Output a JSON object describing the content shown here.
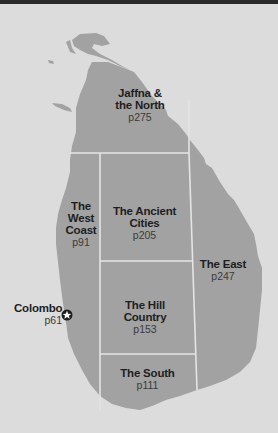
{
  "map": {
    "colors": {
      "background": "#dcdcdc",
      "land": "#a2a2a2",
      "border": "#e4e4e4",
      "text": "#1e1e1e"
    },
    "regions": [
      {
        "id": "jaffna",
        "name_line1": "Jaffna &",
        "name_line2": "the North",
        "page": "p275"
      },
      {
        "id": "west-coast",
        "name_line1": "The",
        "name_line2": "West",
        "name_line3": "Coast",
        "page": "p91"
      },
      {
        "id": "ancient-cities",
        "name_line1": "The Ancient",
        "name_line2": "Cities",
        "page": "p205"
      },
      {
        "id": "east",
        "name_line1": "The East",
        "page": "p247"
      },
      {
        "id": "hill-country",
        "name_line1": "The Hill",
        "name_line2": "Country",
        "page": "p153"
      },
      {
        "id": "south",
        "name_line1": "The South",
        "page": "p111"
      }
    ],
    "city": {
      "name": "Colombo",
      "page": "p61",
      "icon": "star-in-circle-icon"
    }
  }
}
